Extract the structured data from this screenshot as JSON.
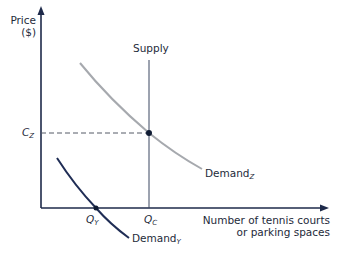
{
  "axes": {
    "y_label_line1": "Price",
    "y_label_line2": "($)",
    "x_label_line1": "Number of tennis courts",
    "x_label_line2": "or parking spaces"
  },
  "labels": {
    "supply": "Supply",
    "price_level": {
      "base": "C",
      "sub": "Z"
    },
    "quantity_y": {
      "base": "Q",
      "sub": "Y"
    },
    "quantity_c": {
      "base": "Q",
      "sub": "C"
    },
    "demand_z": {
      "base": "Demand",
      "sub": "Z"
    },
    "demand_y": {
      "base": "Demand",
      "sub": "Y"
    }
  },
  "colors": {
    "axis": "#1e2a4a",
    "supply": "#3a4660",
    "demand_z": "#a6a9ae",
    "demand_y": "#1f2d55",
    "dashed": "#555b66",
    "point": "#0f1b33"
  }
}
